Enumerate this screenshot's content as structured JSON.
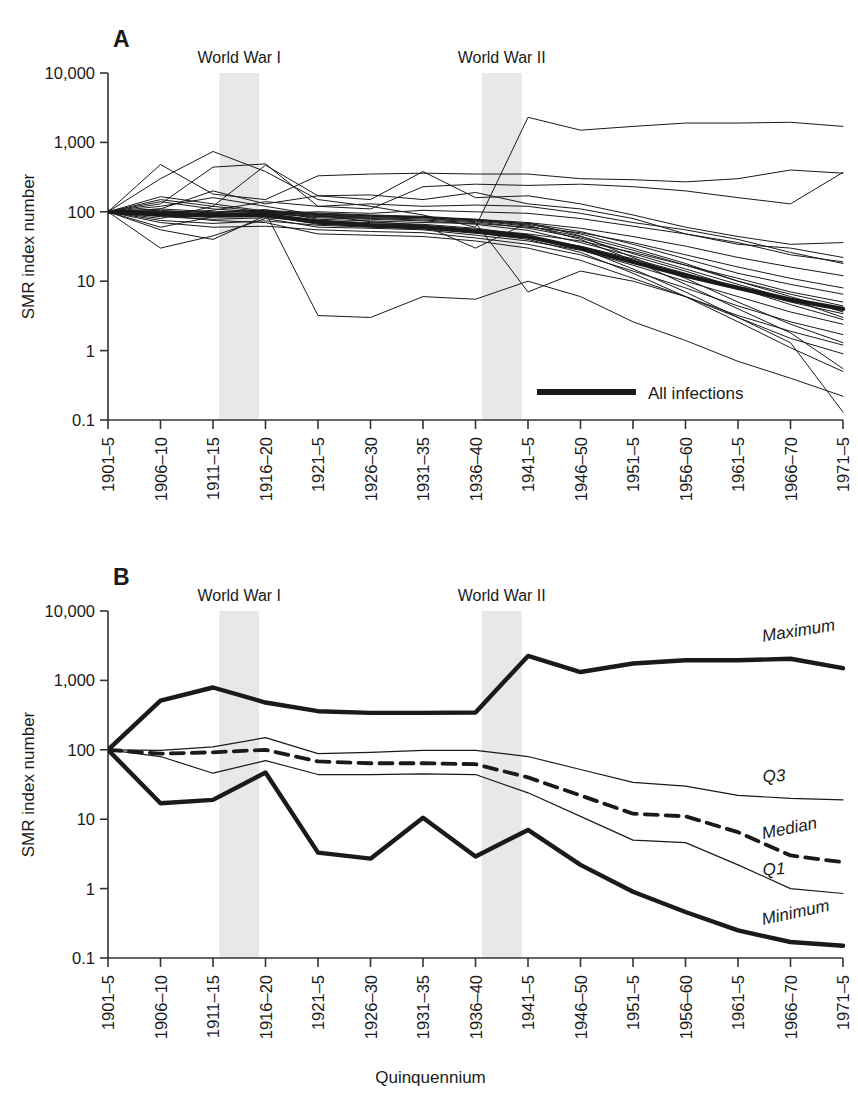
{
  "figure": {
    "width": 858,
    "height": 1111,
    "background": "#ffffff",
    "line_color": "#1a1a1a",
    "band_color": "#e8e8e8",
    "axis_color": "#333333"
  },
  "panelA": {
    "letter": "A",
    "ylabel": "SMR index number",
    "war1_label": "World War I",
    "war2_label": "World War II",
    "legend_label": "All infections",
    "y_ticks": [
      "10,000",
      "1,000",
      "100",
      "10",
      "1",
      "0.1"
    ],
    "x_ticks": [
      "1901–5",
      "1906–10",
      "1911–15",
      "1916–20",
      "1921–5",
      "1926–30",
      "1931–35",
      "1936–40",
      "1941–5",
      "1946–50",
      "1951–5",
      "1956–60",
      "1961–5",
      "1966–70",
      "1971–5"
    ]
  },
  "panelB": {
    "letter": "B",
    "ylabel": "SMR index number",
    "xlabel": "Quinquennium",
    "war1_label": "World War I",
    "war2_label": "World War II",
    "y_ticks": [
      "10,000",
      "1,000",
      "100",
      "10",
      "1",
      "0.1"
    ],
    "x_ticks": [
      "1901–5",
      "1906–10",
      "1911–15",
      "1916–20",
      "1921–5",
      "1926–30",
      "1931–35",
      "1936–40",
      "1941–5",
      "1946–50",
      "1951–5",
      "1956–60",
      "1961–5",
      "1966–70",
      "1971–5"
    ],
    "series_labels": {
      "maximum": "Maximum",
      "q3": "Q3",
      "median": "Median",
      "q1": "Q1",
      "minimum": "Minimum"
    }
  },
  "chart_data": [
    {
      "type": "line",
      "panel": "A",
      "title": "A",
      "xlabel": "Quinquennium",
      "ylabel": "SMR index number",
      "yscale": "log",
      "ylim": [
        0.1,
        10000
      ],
      "grid": false,
      "legend": [
        "All infections"
      ],
      "legend_position": "inside-bottom-right",
      "annotations": [
        "World War I",
        "World War II"
      ],
      "shaded_bands": [
        {
          "label": "World War I",
          "from": "1911–15",
          "to": "1916–20"
        },
        {
          "label": "World War II",
          "from": "1936–40",
          "to": "1941–5"
        }
      ],
      "categories": [
        "1901–5",
        "1906–10",
        "1911–15",
        "1916–20",
        "1921–5",
        "1926–30",
        "1931–35",
        "1936–40",
        "1941–5",
        "1946–50",
        "1951–5",
        "1956–60",
        "1961–5",
        "1966–70",
        "1971–5"
      ],
      "series": [
        {
          "name": "All infections",
          "emphasis": "thick",
          "values": [
            100,
            92,
            88,
            90,
            72,
            64,
            60,
            52,
            44,
            30,
            19,
            12,
            8,
            5.4,
            4.0
          ]
        },
        {
          "name": "cause-1",
          "values": [
            100,
            300,
            740,
            380,
            150,
            120,
            90,
            60,
            2300,
            1500,
            1700,
            1900,
            1900,
            1950,
            1700
          ]
        },
        {
          "name": "cause-2",
          "values": [
            100,
            480,
            180,
            150,
            330,
            350,
            360,
            350,
            350,
            300,
            290,
            270,
            300,
            400,
            360
          ]
        },
        {
          "name": "cause-3",
          "values": [
            100,
            130,
            440,
            490,
            120,
            110,
            230,
            250,
            240,
            250,
            230,
            200,
            160,
            130,
            370
          ]
        },
        {
          "name": "cause-4",
          "values": [
            100,
            150,
            120,
            470,
            170,
            150,
            380,
            160,
            170,
            130,
            90,
            60,
            44,
            34,
            36
          ]
        },
        {
          "name": "cause-5",
          "values": [
            100,
            110,
            200,
            130,
            170,
            175,
            150,
            190,
            130,
            110,
            80,
            48,
            34,
            30,
            22
          ]
        },
        {
          "name": "cause-6",
          "values": [
            100,
            95,
            105,
            140,
            120,
            130,
            120,
            125,
            120,
            95,
            70,
            55,
            40,
            26,
            18
          ]
        },
        {
          "name": "cause-7",
          "values": [
            100,
            88,
            90,
            95,
            100,
            95,
            105,
            100,
            95,
            80,
            62,
            48,
            36,
            24,
            19
          ]
        },
        {
          "name": "cause-8",
          "values": [
            100,
            80,
            120,
            100,
            88,
            84,
            82,
            78,
            70,
            58,
            44,
            32,
            22,
            16,
            12
          ]
        },
        {
          "name": "cause-9",
          "values": [
            100,
            105,
            96,
            108,
            78,
            74,
            70,
            68,
            60,
            50,
            36,
            24,
            16,
            11,
            8
          ]
        },
        {
          "name": "cause-10",
          "values": [
            100,
            60,
            85,
            92,
            70,
            66,
            64,
            56,
            48,
            38,
            26,
            17,
            11,
            7,
            5
          ]
        },
        {
          "name": "cause-11",
          "values": [
            100,
            55,
            40,
            88,
            66,
            62,
            58,
            50,
            42,
            32,
            21,
            13,
            8,
            5,
            3.4
          ]
        },
        {
          "name": "cause-12",
          "values": [
            100,
            30,
            45,
            80,
            60,
            58,
            55,
            46,
            38,
            28,
            17,
            10,
            6,
            3.6,
            2.4
          ]
        },
        {
          "name": "cause-13",
          "values": [
            100,
            70,
            60,
            62,
            55,
            52,
            50,
            42,
            34,
            24,
            14,
            8,
            4.4,
            2.6,
            1.7
          ]
        },
        {
          "name": "cause-14",
          "values": [
            100,
            90,
            75,
            70,
            48,
            46,
            44,
            38,
            30,
            20,
            11,
            6,
            3.2,
            1.9,
            1.2
          ]
        },
        {
          "name": "cause-15",
          "values": [
            100,
            120,
            160,
            120,
            90,
            72,
            64,
            30,
            70,
            45,
            22,
            11,
            5,
            2.4,
            1.3
          ]
        },
        {
          "name": "cause-16",
          "values": [
            100,
            100,
            92,
            96,
            85,
            80,
            76,
            70,
            7,
            14,
            10,
            6,
            3,
            1.5,
            0.9
          ]
        },
        {
          "name": "cause-17",
          "values": [
            100,
            165,
            130,
            102,
            94,
            88,
            84,
            76,
            64,
            40,
            20,
            9,
            4,
            1.8,
            0.55
          ]
        },
        {
          "name": "cause-18",
          "values": [
            100,
            140,
            110,
            98,
            3.2,
            3.0,
            6.0,
            5.5,
            10,
            6,
            2.6,
            1.4,
            0.7,
            0.4,
            0.22
          ]
        },
        {
          "name": "cause-19",
          "values": [
            100,
            75,
            68,
            74,
            64,
            60,
            58,
            50,
            40,
            26,
            13,
            6,
            2.6,
            1.1,
            0.5
          ]
        },
        {
          "name": "cause-20",
          "values": [
            100,
            85,
            78,
            82,
            74,
            70,
            66,
            58,
            46,
            30,
            15,
            7,
            3,
            1.3,
            0.13
          ]
        },
        {
          "name": "cause-21",
          "values": [
            100,
            110,
            100,
            105,
            96,
            90,
            86,
            78,
            66,
            48,
            30,
            18,
            10,
            6,
            3.6
          ]
        },
        {
          "name": "cause-22",
          "values": [
            100,
            96,
            94,
            99,
            90,
            86,
            82,
            74,
            62,
            44,
            28,
            17,
            10,
            6.5,
            4.4
          ]
        },
        {
          "name": "cause-23",
          "values": [
            100,
            102,
            98,
            101,
            92,
            88,
            84,
            76,
            68,
            52,
            34,
            21,
            13,
            9,
            6.5
          ]
        },
        {
          "name": "cause-24",
          "values": [
            100,
            98,
            91,
            94,
            86,
            82,
            79,
            72,
            58,
            42,
            25,
            15,
            9,
            5.5,
            3.0
          ]
        },
        {
          "name": "cause-25",
          "values": [
            100,
            93,
            89,
            97,
            82,
            78,
            74,
            66,
            54,
            36,
            23,
            14,
            8,
            4.6,
            2.8
          ]
        }
      ]
    },
    {
      "type": "line",
      "panel": "B",
      "title": "B",
      "xlabel": "Quinquennium",
      "ylabel": "SMR index number",
      "yscale": "log",
      "ylim": [
        0.1,
        10000
      ],
      "grid": false,
      "legend": [
        "Maximum",
        "Q3",
        "Median",
        "Q1",
        "Minimum"
      ],
      "legend_position": "right-inline-labels",
      "annotations": [
        "World War I",
        "World War II"
      ],
      "shaded_bands": [
        {
          "label": "World War I",
          "from": "1911–15",
          "to": "1916–20"
        },
        {
          "label": "World War II",
          "from": "1936–40",
          "to": "1941–5"
        }
      ],
      "categories": [
        "1901–5",
        "1906–10",
        "1911–15",
        "1916–20",
        "1921–5",
        "1926–30",
        "1931–35",
        "1936–40",
        "1941–5",
        "1946–50",
        "1951–5",
        "1956–60",
        "1961–5",
        "1966–70",
        "1971–5"
      ],
      "series": [
        {
          "name": "Maximum",
          "style": "thick-solid",
          "values": [
            100,
            510,
            790,
            480,
            360,
            340,
            340,
            345,
            2250,
            1320,
            1750,
            1950,
            1950,
            2050,
            1500
          ]
        },
        {
          "name": "Q3",
          "style": "thin-solid",
          "values": [
            100,
            98,
            110,
            150,
            88,
            92,
            98,
            98,
            80,
            52,
            34,
            30,
            22,
            20,
            19
          ]
        },
        {
          "name": "Median",
          "style": "dashed",
          "values": [
            100,
            88,
            92,
            100,
            68,
            64,
            64,
            62,
            40,
            22,
            12,
            11,
            6.5,
            3.0,
            2.4
          ]
        },
        {
          "name": "Q1",
          "style": "thin-solid",
          "values": [
            100,
            80,
            46,
            70,
            44,
            44,
            45,
            44,
            24,
            11,
            5.0,
            4.6,
            2.2,
            1.0,
            0.85
          ]
        },
        {
          "name": "Minimum",
          "style": "thick-solid",
          "values": [
            100,
            17,
            19,
            47,
            3.3,
            2.7,
            10.5,
            2.9,
            7.0,
            2.2,
            0.9,
            0.46,
            0.25,
            0.17,
            0.15
          ]
        }
      ]
    }
  ]
}
